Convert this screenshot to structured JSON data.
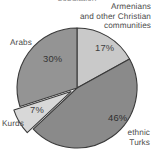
{
  "figure": {
    "title_remnant": "population",
    "background_color": "#ffffff",
    "text_color": "#4b4b4b"
  },
  "labels": {
    "christian": "Armenians\nand other Christian\ncommunities",
    "arabs": "Arabs",
    "kurds": "Kurds",
    "turks": "ethnic\nTurks"
  },
  "percent_labels": {
    "christian": "17%",
    "turks": "46%",
    "arabs": "30%",
    "kurds": "7%"
  },
  "chart_data": {
    "type": "pie",
    "title": "",
    "xlabel": "",
    "ylabel": "",
    "legend_position": "none",
    "grid": false,
    "units": "percent",
    "start_angle_deg": 0,
    "direction": "clockwise",
    "categories": [
      "Armenians and other Christian communities",
      "ethnic Turks",
      "Kurds",
      "Arabs"
    ],
    "values": [
      17,
      46,
      7,
      30
    ],
    "value_labels": [
      "17%",
      "46%",
      "7%",
      "30%"
    ],
    "colors": [
      "#c9c9c9",
      "#8a8a8a",
      "#d8d8d8",
      "#949494"
    ],
    "exploded": [
      false,
      false,
      true,
      false
    ],
    "slices": [
      {
        "name": "Armenians and other Christian communities",
        "value": 17,
        "label": "17%",
        "color": "#c9c9c9",
        "start_deg": 0,
        "end_deg": 61.2,
        "exploded": false
      },
      {
        "name": "ethnic Turks",
        "value": 46,
        "label": "46%",
        "color": "#8a8a8a",
        "start_deg": 61.2,
        "end_deg": 226.8,
        "exploded": false
      },
      {
        "name": "Kurds",
        "value": 7,
        "label": "7%",
        "color": "#d8d8d8",
        "start_deg": 226.8,
        "end_deg": 252.0,
        "exploded": true
      },
      {
        "name": "Arabs",
        "value": 30,
        "label": "30%",
        "color": "#949494",
        "start_deg": 252.0,
        "end_deg": 360.0,
        "exploded": false
      }
    ]
  }
}
